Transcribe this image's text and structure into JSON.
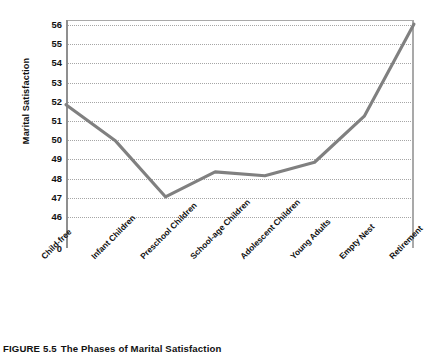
{
  "figure": {
    "caption_number": "FIGURE 5.5",
    "caption_text": "The Phases of Marital Satisfaction"
  },
  "colors": {
    "line": "#808080",
    "gridline": "#a6a6a6",
    "axis": "#8f8f8f",
    "text": "#111111",
    "background": "#ffffff"
  },
  "chart_data": {
    "type": "line",
    "title": "",
    "xlabel": "",
    "ylabel": "Marital Satisfaction",
    "categories": [
      "Child-free",
      "Infant Children",
      "Preschool Children",
      "School-age Children",
      "Adolescent Children",
      "Young Adults",
      "Empty Nest",
      "Retirement"
    ],
    "values": [
      51.8,
      49.9,
      47.0,
      48.3,
      48.1,
      48.8,
      51.2,
      56.0
    ],
    "ytick_labels": [
      "56",
      "55",
      "54",
      "53",
      "52",
      "51",
      "50",
      "49",
      "48",
      "47",
      "46",
      "0"
    ],
    "ytick_values": [
      56,
      55,
      54,
      53,
      52,
      51,
      50,
      49,
      48,
      47,
      46,
      0
    ],
    "ylim": [
      45.6,
      56.3
    ],
    "axis_break_below": 46,
    "grid": true,
    "grid_style": "dotted-horizontal",
    "legend": "none",
    "markers": false
  }
}
